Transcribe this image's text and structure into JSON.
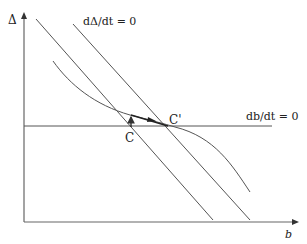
{
  "diagram": {
    "axes": {
      "y_label": "Δ",
      "x_label": "b"
    },
    "curves": {
      "delta_nullcline_label": "dΔ/dt = 0",
      "b_nullcline_label": "db/dt = 0"
    },
    "points": {
      "initial_label": "C",
      "new_label": "C'"
    },
    "colors": {
      "line": "#555555",
      "text": "#222222"
    }
  }
}
